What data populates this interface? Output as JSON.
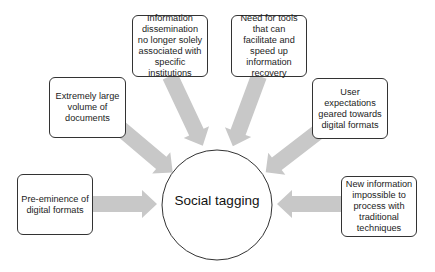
{
  "diagram": {
    "type": "radial-convergence",
    "center": {
      "label": "Social tagging",
      "shape": "circle"
    },
    "factors": [
      {
        "id": "preeminence",
        "label": "Pre-eminence of digital formats",
        "position": "left"
      },
      {
        "id": "volume",
        "label": "Extremely large volume of documents",
        "position": "upper-left"
      },
      {
        "id": "dissemination",
        "label": "Information dissemination no longer solely associated with specific institutions",
        "position": "top-left"
      },
      {
        "id": "tools",
        "label": "Need for tools that can facilitate and speed up information recovery",
        "position": "top-right"
      },
      {
        "id": "expectations",
        "label": "User expectations geared towards digital formats",
        "position": "upper-right"
      },
      {
        "id": "new-info",
        "label": "New information impossible to process with traditional techniques",
        "position": "right"
      }
    ],
    "colors": {
      "arrow": "#c8c8c8",
      "border": "#333333",
      "text": "#1a1a1a",
      "background": "#ffffff"
    }
  }
}
